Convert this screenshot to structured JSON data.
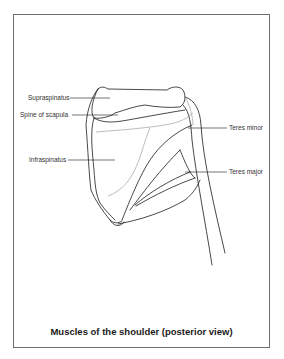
{
  "diagram": {
    "title": "Muscles of the shoulder (posterior view)",
    "labels": {
      "supraspinatus": "Supraspinatus",
      "spine_of_scapula": "Spine of scapula",
      "infraspinatus": "Infraspinatus",
      "teres_minor": "Teres minor",
      "teres_major": "Teres major"
    }
  },
  "colors": {
    "line": "#1a1a1a",
    "faint_line": "#a0a0a0",
    "frame": "#6e6e6e"
  }
}
